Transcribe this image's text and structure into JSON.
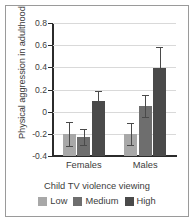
{
  "figure": {
    "border_color": "#9a9a9a",
    "background": "#ffffff"
  },
  "chart_data": {
    "type": "bar",
    "title": "",
    "xlabel": "Child TV violence viewing",
    "ylabel": "Physical aggression in adulthood",
    "categories": [
      "Females",
      "Males"
    ],
    "ylim": [
      -0.4,
      0.8
    ],
    "yticks": [
      -0.4,
      -0.2,
      0,
      0.2,
      0.4,
      0.6,
      0.8
    ],
    "ytick_labels": [
      "-0.4",
      "-0.2",
      "0",
      "0.2",
      "0.4",
      "0.6",
      "0.8"
    ],
    "grid": true,
    "legend_position": "bottom",
    "series": [
      {
        "name": "Low",
        "color": "#a8a8a8",
        "values": [
          -0.2,
          -0.2
        ],
        "errors": [
          0.11,
          0.1
        ]
      },
      {
        "name": "Medium",
        "color": "#6e6e6e",
        "values": [
          -0.23,
          0.05
        ],
        "errors": [
          0.07,
          0.1
        ]
      },
      {
        "name": "High",
        "color": "#4a4a4a",
        "values": [
          0.1,
          0.39
        ],
        "errors": [
          0.09,
          0.19
        ]
      }
    ]
  }
}
